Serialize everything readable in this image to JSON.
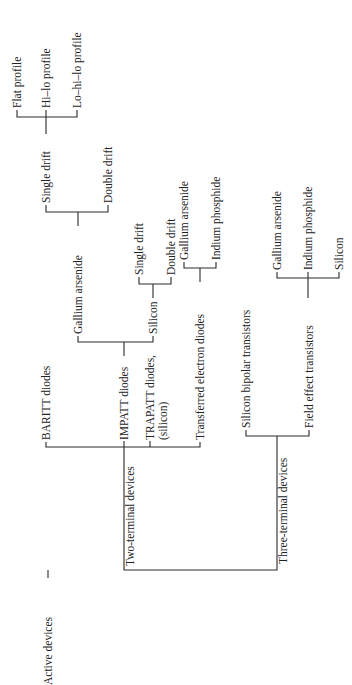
{
  "diagram": {
    "root": "Active devices",
    "two_terminal": {
      "label": "Two-terminal devices",
      "baritt": "BARITT diodes",
      "impatt": {
        "label": "IMPATT diodes",
        "gaas": {
          "label": "Gallium arsenide",
          "single_drift": {
            "label": "Single drift",
            "flat": "Flat profile",
            "hilo": "Hi–lo profile",
            "lohilo": "Lo–hi–lo profile"
          },
          "double_drift": "Double drift"
        },
        "silicon": {
          "label": "Silicon",
          "single_drift": "Single drift",
          "double_drift": "Double drift"
        }
      },
      "trapatt": {
        "line1": "TRAPATT diodes,",
        "line2": "(silicon)"
      },
      "ted": {
        "label": "Transferred electron diodes",
        "gaas": "Gallium arsenide",
        "inp": "Indium phosphide"
      }
    },
    "three_terminal": {
      "label": "Three-terminal devices",
      "bjt": "Silicon bipolar transistors",
      "fet": {
        "label": "Field effect transistors",
        "gaas": "Gallium arsenide",
        "inp": "Indium phosphide",
        "si": "Silicon"
      }
    }
  }
}
